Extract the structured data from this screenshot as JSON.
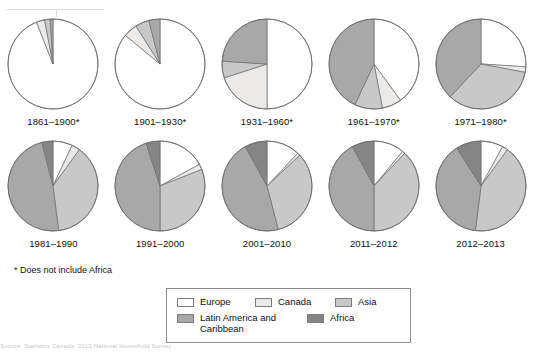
{
  "footnote": "* Does not include Africa",
  "legend": {
    "items": [
      {
        "label": "Europe",
        "color": "#ffffff"
      },
      {
        "label": "Canada",
        "color": "#eceae8"
      },
      {
        "label": "Asia",
        "color": "#c8c8c8"
      },
      {
        "label": "Latin America and Caribbean",
        "color": "#a8a8a8"
      },
      {
        "label": "Africa",
        "color": "#858585"
      }
    ]
  },
  "bottom_source": "Source: Statistics Canada, 2013 National Household Survey",
  "chart_data": {
    "type": "pie",
    "title": "",
    "legend_position": "bottom",
    "categories": [
      "Europe",
      "Canada",
      "Asia",
      "Latin America and Caribbean",
      "Africa"
    ],
    "colors": [
      "#ffffff",
      "#eceae8",
      "#c8c8c8",
      "#a8a8a8",
      "#858585"
    ],
    "units": "percent",
    "charts": [
      {
        "label": "1861–1900*",
        "values": [
          94.0,
          3.0,
          2.0,
          1.0,
          0.0
        ]
      },
      {
        "label": "1901–1930*",
        "values": [
          86.0,
          5.0,
          5.0,
          4.0,
          0.0
        ]
      },
      {
        "label": "1931–1960*",
        "values": [
          50.0,
          20.0,
          6.0,
          24.0,
          0.0
        ]
      },
      {
        "label": "1961–1970*",
        "values": [
          40.0,
          7.0,
          10.0,
          43.0,
          0.0
        ]
      },
      {
        "label": "1971–1980*",
        "values": [
          26.0,
          2.0,
          34.0,
          38.0,
          0.0
        ]
      },
      {
        "label": "1981–1990",
        "values": [
          7.0,
          3.0,
          38.0,
          48.0,
          4.0
        ]
      },
      {
        "label": "1991–2000",
        "values": [
          17.0,
          2.0,
          31.0,
          45.0,
          5.0
        ]
      },
      {
        "label": "2001–2010",
        "values": [
          12.0,
          1.0,
          33.0,
          46.0,
          8.0
        ]
      },
      {
        "label": "2011–2012",
        "values": [
          11.0,
          1.0,
          38.0,
          42.0,
          8.0
        ]
      },
      {
        "label": "2012–2013",
        "values": [
          8.0,
          2.0,
          42.0,
          39.0,
          9.0
        ]
      }
    ]
  }
}
